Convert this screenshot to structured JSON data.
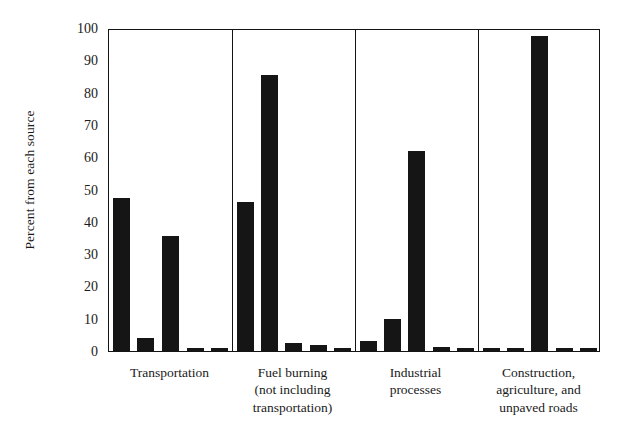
{
  "chart_data": {
    "type": "bar",
    "title": "",
    "subtitle": "",
    "xlabel": "",
    "ylabel": "Percent from each source",
    "ylim": [
      0,
      100
    ],
    "yticks": [
      0,
      10,
      20,
      30,
      40,
      50,
      60,
      70,
      80,
      90,
      100
    ],
    "ytick_labels": [
      "0",
      "10",
      "20",
      "30",
      "40",
      "50",
      "60",
      "70",
      "80",
      "90",
      "100"
    ],
    "grid": false,
    "legend": "none",
    "bar_color": "#151515",
    "axis_color": "#141414",
    "group_separators": true,
    "categories": [
      "Transportation",
      "Fuel burning (not including transportation)",
      "Industrial processes",
      "Construction, agriculture, and unpaved roads"
    ],
    "category_label_lines": [
      [
        "Transportation"
      ],
      [
        "Fuel burning",
        "(not including",
        "transportation)"
      ],
      [
        "Industrial",
        "processes"
      ],
      [
        "Construction,",
        "agriculture, and",
        "unpaved roads"
      ]
    ],
    "groups": [
      {
        "name": "Transportation",
        "values": [
          47.5,
          4.0,
          35.5,
          1.0,
          0.8
        ]
      },
      {
        "name": "Fuel burning (not including transportation)",
        "values": [
          46.0,
          85.5,
          2.5,
          1.8,
          1.0
        ]
      },
      {
        "name": "Industrial processes",
        "values": [
          3.0,
          10.0,
          62.0,
          1.2,
          0.8
        ]
      },
      {
        "name": "Construction, agriculture, and unpaved roads",
        "values": [
          0.8,
          0.8,
          97.5,
          0.8,
          0.8
        ]
      }
    ],
    "bars_per_group": 5,
    "series": [
      {
        "name": "pollutant-1",
        "values": [
          47.5,
          46.0,
          3.0,
          0.8
        ]
      },
      {
        "name": "pollutant-2",
        "values": [
          4.0,
          85.5,
          10.0,
          0.8
        ]
      },
      {
        "name": "pollutant-3",
        "values": [
          35.5,
          2.5,
          62.0,
          97.5
        ]
      },
      {
        "name": "pollutant-4",
        "values": [
          1.0,
          1.8,
          1.2,
          0.8
        ]
      },
      {
        "name": "pollutant-5",
        "values": [
          0.8,
          1.0,
          0.8,
          0.8
        ]
      }
    ]
  }
}
